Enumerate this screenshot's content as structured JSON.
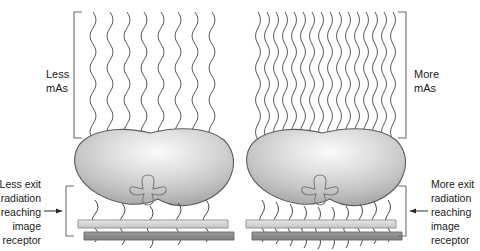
{
  "figure": {
    "background_color": "#ffffff",
    "width": 480,
    "height": 251
  },
  "panels": [
    {
      "id": "left",
      "side": "left",
      "mas_label_line1": "Less",
      "mas_label_line2": "mAs",
      "incident_ray_count": 8,
      "exit_ray_count": 5,
      "caption_lines": [
        "Less exit",
        "radiation",
        "reaching",
        "image",
        "receptor"
      ],
      "caption_align": "right",
      "arrow_direction": "right"
    },
    {
      "id": "right",
      "side": "right",
      "mas_label_line1": "More",
      "mas_label_line2": "mAs",
      "incident_ray_count": 16,
      "exit_ray_count": 10,
      "caption_lines": [
        "More exit",
        "radiation",
        "reaching",
        "image",
        "receptor"
      ],
      "caption_align": "left",
      "arrow_direction": "left"
    }
  ],
  "anatomy": {
    "name": "abdomen-cross-section",
    "feature": "vertebra",
    "fill_light": "#f2f2f2",
    "fill_mid": "#c9c9c9",
    "fill_edge": "#a8a8a8",
    "outline_color": "#5d5d5d"
  },
  "receptor": {
    "name": "image-receptor",
    "top_plate_color": "#d8d8d8",
    "top_plate_edge_color": "#8d8d8d",
    "base_plate_color": "#8f8f8f",
    "base_plate_edge_color": "#6a6a6a"
  },
  "colors": {
    "ray_stroke": "#4a4a4a",
    "bracket_stroke": "#6b6b6b",
    "text": "#1a1a1a",
    "arrow": "#2b2b2b"
  }
}
